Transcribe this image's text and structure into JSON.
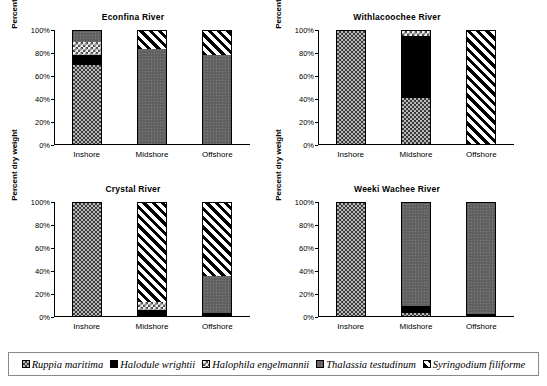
{
  "axis": {
    "ylabel": "Percent dry weight",
    "yticks": [
      "100%",
      "80%",
      "60%",
      "40%",
      "20%",
      "0%"
    ],
    "categories": [
      "Inshore",
      "Midshore",
      "Offshore"
    ]
  },
  "legend": {
    "items": [
      {
        "label": "Ruppia maritima",
        "pattern": "crosshatch",
        "color": "#b9b9b9"
      },
      {
        "label": "Halodule wrightii",
        "pattern": "solid-black",
        "color": "#000000"
      },
      {
        "label": "Halophila engelmannii",
        "pattern": "light-checker",
        "color": "#f2f2f2"
      },
      {
        "label": "Thalassia testudinum",
        "pattern": "gray-stipple",
        "color": "#636363"
      },
      {
        "label": "Syringodium filiforme",
        "pattern": "diagonal-stripe",
        "color": "#ffffff"
      }
    ]
  },
  "panels": [
    {
      "title": "Econfina River"
    },
    {
      "title": "Withlacoochee River"
    },
    {
      "title": "Crystal River"
    },
    {
      "title": "Weeki Wachee River"
    }
  ],
  "chart_data": [
    {
      "type": "bar",
      "title": "Econfina River",
      "xlabel": "",
      "ylabel": "Percent dry weight",
      "ylim": [
        0,
        100
      ],
      "grid": false,
      "stacked": true,
      "categories": [
        "Inshore",
        "Midshore",
        "Offshore"
      ],
      "series": [
        {
          "name": "Ruppia maritima",
          "values": [
            70,
            0,
            0
          ]
        },
        {
          "name": "Halodule wrightii",
          "values": [
            9,
            0,
            0
          ]
        },
        {
          "name": "Halophila engelmannii",
          "values": [
            11,
            0,
            0
          ]
        },
        {
          "name": "Thalassia testudinum",
          "values": [
            10,
            84,
            79
          ]
        },
        {
          "name": "Syringodium filiforme",
          "values": [
            0,
            16,
            21
          ]
        }
      ]
    },
    {
      "type": "bar",
      "title": "Withlacoochee River",
      "xlabel": "",
      "ylabel": "Percent dry weight",
      "ylim": [
        0,
        100
      ],
      "grid": false,
      "stacked": true,
      "categories": [
        "Inshore",
        "Midshore",
        "Offshore"
      ],
      "series": [
        {
          "name": "Ruppia maritima",
          "values": [
            100,
            41,
            0
          ]
        },
        {
          "name": "Halodule wrightii",
          "values": [
            0,
            55,
            0
          ]
        },
        {
          "name": "Halophila engelmannii",
          "values": [
            0,
            4,
            0
          ]
        },
        {
          "name": "Thalassia testudinum",
          "values": [
            0,
            0,
            0
          ]
        },
        {
          "name": "Syringodium filiforme",
          "values": [
            0,
            0,
            100
          ]
        }
      ]
    },
    {
      "type": "bar",
      "title": "Crystal River",
      "xlabel": "",
      "ylabel": "Percent dry weight",
      "ylim": [
        0,
        100
      ],
      "grid": false,
      "stacked": true,
      "categories": [
        "Inshore",
        "Midshore",
        "Offshore"
      ],
      "series": [
        {
          "name": "Ruppia maritima",
          "values": [
            100,
            0,
            0
          ]
        },
        {
          "name": "Halodule wrightii",
          "values": [
            0,
            5,
            3
          ]
        },
        {
          "name": "Halophila engelmannii",
          "values": [
            0,
            7,
            0
          ]
        },
        {
          "name": "Thalassia testudinum",
          "values": [
            0,
            0,
            32
          ]
        },
        {
          "name": "Syringodium filiforme",
          "values": [
            0,
            88,
            65
          ]
        }
      ]
    },
    {
      "type": "bar",
      "title": "Weeki Wachee River",
      "xlabel": "",
      "ylabel": "Percent dry weight",
      "ylim": [
        0,
        100
      ],
      "grid": false,
      "stacked": true,
      "categories": [
        "Inshore",
        "Midshore",
        "Offshore"
      ],
      "series": [
        {
          "name": "Ruppia maritima",
          "values": [
            100,
            3,
            0
          ]
        },
        {
          "name": "Halodule wrightii",
          "values": [
            0,
            6,
            2
          ]
        },
        {
          "name": "Halophila engelmannii",
          "values": [
            0,
            0,
            0
          ]
        },
        {
          "name": "Thalassia testudinum",
          "values": [
            0,
            91,
            98
          ]
        },
        {
          "name": "Syringodium filiforme",
          "values": [
            0,
            0,
            0
          ]
        }
      ]
    }
  ]
}
